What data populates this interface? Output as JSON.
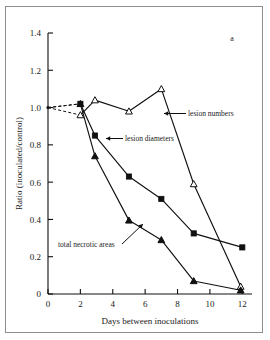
{
  "figure": {
    "panel_label": "a",
    "border_color": "#8d8d8d",
    "line_color": "#101010",
    "background": "#ffffff"
  },
  "axes": {
    "x_title": "Days between inoculations",
    "y_title": "Ratio (inoculated/control)",
    "x_ticks": [
      "0",
      "2",
      "4",
      "6",
      "8",
      "10",
      "12"
    ],
    "y_ticks": [
      "0",
      "0.2",
      "0.4",
      "0.6",
      "0.8",
      "1.0",
      "1.2",
      "1.4"
    ]
  },
  "annotations": {
    "lesion_numbers": "lesion numbers",
    "lesion_diameters": "lesion diameters",
    "total_necrotic_areas": "total necrotic areas"
  },
  "chart_data": {
    "type": "line",
    "title": "",
    "panel": "a",
    "xlabel": "Days between inoculations",
    "ylabel": "Ratio (inoculated/control)",
    "xlim": [
      0,
      12.6
    ],
    "ylim": [
      0,
      1.4
    ],
    "xticks": [
      0,
      2,
      4,
      6,
      8,
      10,
      12
    ],
    "yticks": [
      0,
      0.2,
      0.4,
      0.6,
      0.8,
      1.0,
      1.2,
      1.4
    ],
    "grid": false,
    "legend": "inline-annotations",
    "reference_origin": {
      "x": 0,
      "y": 1.0,
      "note": "dashed leaders from y=1.0 at x=0 to first points"
    },
    "series": [
      {
        "name": "lesion numbers",
        "marker": "open-triangle",
        "x": [
          2.0,
          2.9,
          5.0,
          7.0,
          9.0,
          11.9
        ],
        "y": [
          0.96,
          1.04,
          0.98,
          1.1,
          0.59,
          0.04
        ]
      },
      {
        "name": "lesion diameters",
        "marker": "filled-square",
        "x": [
          2.0,
          2.9,
          5.0,
          7.0,
          9.0,
          12.0
        ],
        "y": [
          1.02,
          0.85,
          0.63,
          0.51,
          0.325,
          0.25
        ]
      },
      {
        "name": "total necrotic areas",
        "marker": "filled-triangle",
        "x": [
          2.0,
          2.9,
          5.0,
          7.0,
          9.0,
          11.9
        ],
        "y": [
          1.02,
          0.74,
          0.395,
          0.29,
          0.07,
          0.02
        ]
      }
    ]
  }
}
